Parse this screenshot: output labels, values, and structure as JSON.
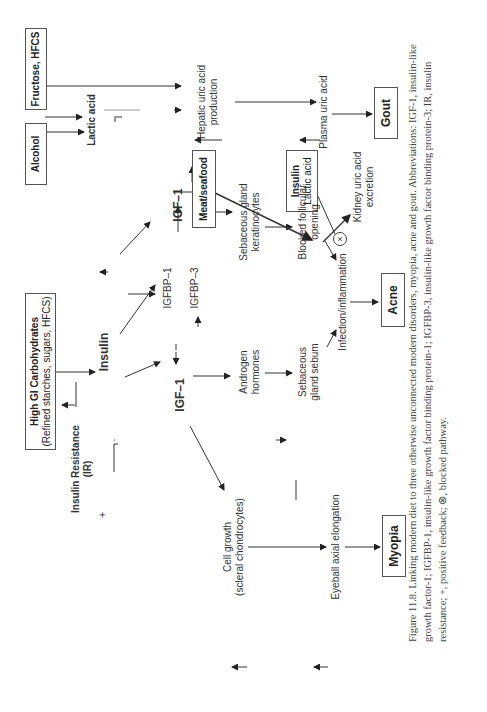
{
  "figure": {
    "label": "Figure 11.8.",
    "caption": "Figure 11.8. Linking modern diet to three otherwise unconnected modern disorders, myopia, acne and gout. Abbreviations: IGF-1, insulin-like growth factor-1; IGFBP-1, insulin-like growth factor binding protein-1; IGFBP-3, insulin-like growth factor binding protein-3; IR, insulin resistance; +, positive feedback; ⊗, blocked pathway.",
    "orientation": "rotated 90° counter-clockwise"
  },
  "inputs": {
    "high_gi": {
      "title": "High GI Carbohydrates",
      "subtitle": "(Refined starches, sugars, HFCS)"
    },
    "alcohol": "Alcohol",
    "fructose": "Fructose, HFCS",
    "meat": "Meat/seafood",
    "insulin_lactic": {
      "title": "Insulin",
      "subtitle": "Lactic acid"
    }
  },
  "nodes": {
    "insulin": "Insulin",
    "insulin_resistance": {
      "line1": "Insulin Resistance",
      "line2": "(IR)"
    },
    "positive_feedback": "+",
    "igf1_left": "IGF–1",
    "igf1_right": "IGF–1",
    "igfbp1": "IGFBP–1",
    "igfbp3": "IGFBP–3",
    "androgen": {
      "line1": "Androgen",
      "line2": "hormones"
    },
    "sebaceous_keratinocytes": {
      "line1": "Sebaceous gland",
      "line2": "keratinocytes"
    },
    "sebaceous_sebum": {
      "line1": "Sebaceous",
      "line2": "gland sebum"
    },
    "blocked_follicular": {
      "line1": "Blocked follicular",
      "line2": "opening"
    },
    "infection": "Infection/inflammation",
    "cell_growth": {
      "line1": "Cell growth",
      "line2": "(scleral chondrocytes)"
    },
    "eyeball": "Eyeball axial elongation",
    "lactic_acid": "Lactic acid",
    "hepatic": {
      "line1": "Hepatic uric acid",
      "line2": "production"
    },
    "plasma": "Plasma uric acid",
    "kidney": {
      "line1": "Kidney uric acid",
      "line2": "excretion"
    },
    "blocked_symbol": "×"
  },
  "outcomes": {
    "myopia": "Myopia",
    "acne": "Acne",
    "gout": "Gout"
  }
}
